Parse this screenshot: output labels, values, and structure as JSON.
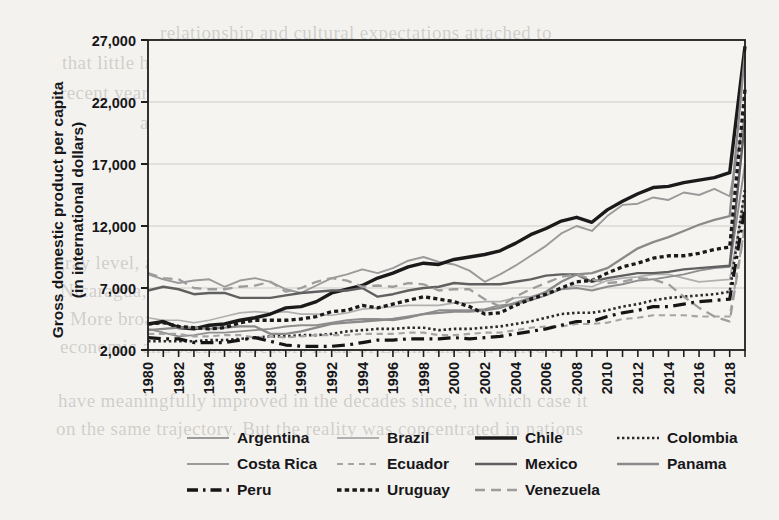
{
  "page": {
    "background_color": "#f3f2ef",
    "ghost_text": [
      {
        "text": "relationship and cultural expectations attached to",
        "x": 160,
        "y": 22
      },
      {
        "text": "that little help became by far the most important, while it matters in the",
        "x": 62,
        "y": 52
      },
      {
        "text": "recent years and moreover that their lives declined; the ever so-called",
        "x": 60,
        "y": 82
      },
      {
        "text": "as the case of health, education, and life expectancy. As",
        "x": 140,
        "y": 112
      },
      {
        "text": "the poverty line declined from 53 percent in",
        "x": 185,
        "y": 140
      },
      {
        "text": "of the country to nearly 4 percent in the",
        "x": 200,
        "y": 168
      },
      {
        "text": "income per capita from 1980 to 2019. Chile, Costa Rica",
        "x": 150,
        "y": 196
      },
      {
        "text": "in a southern trade under this period, but not",
        "x": 175,
        "y": 224
      },
      {
        "text": "gray level, and major developments under consideration: Honduras,",
        "x": 55,
        "y": 252
      },
      {
        "text": "Nicaragua, Paraguay, El Salvador, Bolivia, Guatemala, and Haiti.",
        "x": 60,
        "y": 280
      },
      {
        "text": "More broadly, there is a growing consensus that the",
        "x": 70,
        "y": 308
      },
      {
        "text": "economic and social indicators in all of Latin America failed to",
        "x": 60,
        "y": 336
      },
      {
        "text": "have meaningfully improved in the decades since, in which case it",
        "x": 58,
        "y": 390
      },
      {
        "text": "on the same trajectory. But the reality was concentrated in nations",
        "x": 56,
        "y": 418
      }
    ]
  },
  "chart_data": {
    "type": "line",
    "title": "",
    "xlabel": "",
    "ylabel": "Gross domestic product per capita\n(in international dollars)",
    "ylabel_line1": "Gross domestic product per capita",
    "ylabel_line2": "(in international dollars)",
    "ylim": [
      2000,
      27000
    ],
    "yticks": [
      2000,
      7000,
      12000,
      17000,
      22000,
      27000
    ],
    "ytick_labels": [
      "2,000",
      "7,000",
      "12,000",
      "17,000",
      "22,000",
      "27,000"
    ],
    "xlim": [
      1980,
      2019
    ],
    "xticks": [
      1980,
      1981,
      1982,
      1983,
      1984,
      1985,
      1986,
      1987,
      1988,
      1989,
      1990,
      1991,
      1992,
      1993,
      1994,
      1995,
      1996,
      1997,
      1998,
      1999,
      2000,
      2001,
      2002,
      2003,
      2004,
      2005,
      2006,
      2007,
      2008,
      2009,
      2010,
      2011,
      2012,
      2013,
      2014,
      2015,
      2016,
      2017,
      2018,
      2019
    ],
    "xtick_labels": [
      "1980",
      "1982",
      "1984",
      "1986",
      "1988",
      "1990",
      "1992",
      "1994",
      "1996",
      "1998",
      "2000",
      "2002",
      "2004",
      "2006",
      "2008",
      "2010",
      "2012",
      "2014",
      "2016",
      "2018"
    ],
    "xtick_label_years": [
      1980,
      1982,
      1984,
      1986,
      1988,
      1990,
      1992,
      1994,
      1996,
      1998,
      2000,
      2002,
      2004,
      2006,
      2008,
      2010,
      2012,
      2014,
      2016,
      2018
    ],
    "grid": true,
    "grid_axis": "y",
    "legend_position": "below",
    "x": [
      1980,
      1981,
      1982,
      1983,
      1984,
      1985,
      1986,
      1987,
      1988,
      1989,
      1990,
      1991,
      1992,
      1993,
      1994,
      1995,
      1996,
      1997,
      1998,
      1999,
      2000,
      2001,
      2002,
      2003,
      2004,
      2005,
      2006,
      2007,
      2008,
      2009,
      2010,
      2011,
      2012,
      2013,
      2014,
      2015,
      2016,
      2017,
      2018,
      2019
    ],
    "series": [
      {
        "name": "Argentina",
        "color": "#9a9a9a",
        "width": 1.9,
        "dash": "none",
        "values": [
          8100,
          7700,
          7400,
          7600,
          7700,
          7100,
          7600,
          7800,
          7500,
          6900,
          6600,
          7200,
          7800,
          8100,
          8500,
          8200,
          8600,
          9200,
          9500,
          9100,
          8900,
          8400,
          7500,
          8100,
          8800,
          9600,
          10400,
          11400,
          12000,
          11600,
          12800,
          13700,
          13800,
          14300,
          14100,
          14700,
          14500,
          15000,
          14400,
          21000
        ]
      },
      {
        "name": "Brazil",
        "color": "#b0b0b0",
        "width": 1.7,
        "dash": "none",
        "values": [
          4600,
          4400,
          4400,
          4200,
          4400,
          4700,
          5000,
          5100,
          5000,
          5100,
          4900,
          4900,
          4800,
          5000,
          5300,
          5400,
          5500,
          5600,
          5600,
          5600,
          5800,
          5800,
          5900,
          5900,
          6200,
          6300,
          6600,
          6900,
          7200,
          7100,
          7600,
          7800,
          7900,
          8100,
          8100,
          7800,
          7500,
          7600,
          7700,
          14500
        ]
      },
      {
        "name": "Chile",
        "color": "#1a1a1a",
        "width": 3.4,
        "dash": "none",
        "values": [
          4100,
          4300,
          3800,
          3700,
          4000,
          4100,
          4400,
          4600,
          4900,
          5400,
          5500,
          5900,
          6600,
          6900,
          7200,
          7800,
          8200,
          8700,
          9000,
          8900,
          9300,
          9500,
          9700,
          10000,
          10600,
          11300,
          11800,
          12400,
          12700,
          12300,
          13300,
          14000,
          14600,
          15100,
          15200,
          15500,
          15700,
          15900,
          16300,
          26500
        ]
      },
      {
        "name": "Colombia",
        "color": "#2a2a2a",
        "width": 2.6,
        "dash": "dotted",
        "values": [
          2700,
          2700,
          2700,
          2700,
          2800,
          2800,
          2900,
          3000,
          3100,
          3100,
          3200,
          3200,
          3300,
          3500,
          3600,
          3700,
          3700,
          3800,
          3800,
          3600,
          3700,
          3700,
          3800,
          3900,
          4100,
          4300,
          4600,
          4900,
          5000,
          5000,
          5200,
          5500,
          5700,
          6000,
          6200,
          6300,
          6400,
          6500,
          6700,
          15000
        ]
      },
      {
        "name": "Costa Rica",
        "color": "#8e8e8e",
        "width": 1.9,
        "dash": "none",
        "values": [
          3700,
          3400,
          3100,
          3200,
          3400,
          3400,
          3500,
          3600,
          3700,
          3900,
          4000,
          4000,
          4200,
          4400,
          4500,
          4500,
          4400,
          4600,
          4900,
          5200,
          5200,
          5200,
          5300,
          5600,
          5700,
          6000,
          6400,
          6900,
          7000,
          6800,
          7100,
          7300,
          7600,
          7700,
          7900,
          8100,
          8400,
          8600,
          8700,
          17000
        ]
      },
      {
        "name": "Ecuador",
        "color": "#a5a5a5",
        "width": 2.1,
        "dash": "dashed-med",
        "values": [
          3300,
          3300,
          3300,
          3100,
          3100,
          3200,
          3200,
          3000,
          3100,
          3000,
          3100,
          3200,
          3200,
          3200,
          3300,
          3300,
          3300,
          3400,
          3400,
          3200,
          3200,
          3300,
          3400,
          3400,
          3600,
          3800,
          3900,
          3900,
          4100,
          4100,
          4200,
          4500,
          4600,
          4800,
          4800,
          4800,
          4700,
          4700,
          4700,
          12000
        ]
      },
      {
        "name": "Mexico",
        "color": "#606060",
        "width": 2.4,
        "dash": "none",
        "values": [
          6800,
          7100,
          6900,
          6500,
          6600,
          6600,
          6200,
          6200,
          6200,
          6400,
          6600,
          6700,
          6800,
          6800,
          7000,
          6300,
          6500,
          6800,
          7000,
          7100,
          7400,
          7300,
          7300,
          7300,
          7500,
          7700,
          8000,
          8100,
          8100,
          7500,
          7800,
          8000,
          8200,
          8200,
          8300,
          8500,
          8600,
          8700,
          8800,
          20500
        ]
      },
      {
        "name": "Panama",
        "color": "#8a8a8a",
        "width": 2.3,
        "dash": "none",
        "values": [
          3600,
          3700,
          3800,
          3800,
          3700,
          3800,
          3900,
          3900,
          3300,
          3300,
          3500,
          3800,
          4100,
          4200,
          4300,
          4400,
          4500,
          4700,
          4900,
          5000,
          5100,
          5100,
          5200,
          5400,
          5800,
          6200,
          6700,
          7500,
          8100,
          8200,
          8600,
          9400,
          10200,
          10700,
          11100,
          11600,
          12100,
          12500,
          12800,
          26000
        ]
      },
      {
        "name": "Peru",
        "color": "#151515",
        "width": 3.2,
        "dash": "dashdot",
        "values": [
          3000,
          2900,
          2900,
          2600,
          2600,
          2600,
          2800,
          3000,
          2700,
          2400,
          2300,
          2300,
          2300,
          2400,
          2600,
          2800,
          2800,
          2900,
          2900,
          2900,
          3000,
          2900,
          3000,
          3100,
          3300,
          3500,
          3700,
          4000,
          4300,
          4300,
          4700,
          5000,
          5200,
          5500,
          5500,
          5700,
          5900,
          6000,
          6100,
          13500
        ]
      },
      {
        "name": "Uruguay",
        "color": "#1a1a1a",
        "width": 3.3,
        "dash": "dotted-thick",
        "values": [
          4100,
          4200,
          3900,
          3800,
          3700,
          3800,
          4200,
          4400,
          4400,
          4400,
          4500,
          4700,
          5100,
          5200,
          5600,
          5400,
          5700,
          6000,
          6300,
          6100,
          5900,
          5500,
          4900,
          5000,
          5600,
          6100,
          6500,
          7000,
          7500,
          7600,
          8200,
          8700,
          9000,
          9400,
          9600,
          9600,
          9800,
          10100,
          10300,
          23000
        ]
      },
      {
        "name": "Venezuela",
        "color": "#9d9d9d",
        "width": 2.3,
        "dash": "dashed-long",
        "values": [
          8200,
          7800,
          7700,
          7000,
          6900,
          6900,
          7100,
          7200,
          7500,
          6700,
          7000,
          7500,
          7800,
          7600,
          7100,
          7200,
          7100,
          7400,
          7300,
          6800,
          6900,
          6900,
          6100,
          5500,
          6300,
          6900,
          7400,
          7900,
          8100,
          7700,
          7400,
          7500,
          7800,
          7700,
          7300,
          6300,
          5400,
          4700,
          4300,
          12000
        ]
      }
    ]
  },
  "legend": {
    "rows": [
      [
        {
          "name": "Argentina",
          "style": "solid-thin-gray"
        },
        {
          "name": "Brazil",
          "style": "solid-thin-lightgray"
        },
        {
          "name": "Chile",
          "style": "solid-thick-black"
        },
        {
          "name": "Colombia",
          "style": "dotted-fine-black"
        }
      ],
      [
        {
          "name": "Costa Rica",
          "style": "solid-thin-gray"
        },
        {
          "name": "Ecuador",
          "style": "dashed-med-gray"
        },
        {
          "name": "Mexico",
          "style": "solid-med-darkgray"
        },
        {
          "name": "Panama",
          "style": "solid-med-gray"
        }
      ],
      [
        {
          "name": "Peru",
          "style": "dashdot-thick-black"
        },
        {
          "name": "Uruguay",
          "style": "dotted-thick-black"
        },
        {
          "name": "Venezuela",
          "style": "dashed-long-gray"
        }
      ]
    ]
  }
}
